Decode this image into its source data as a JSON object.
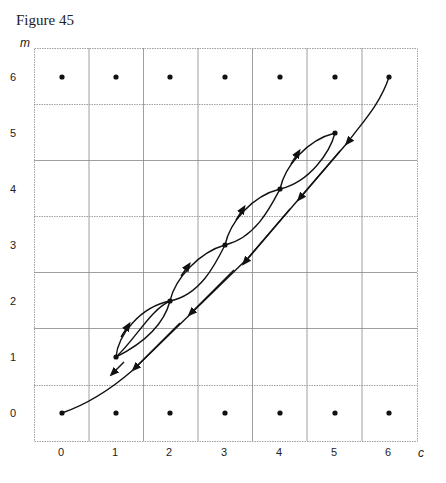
{
  "figure": {
    "title": "Figure 45",
    "x_axis_label": "c",
    "y_axis_label": "m",
    "x_ticks": [
      "0",
      "1",
      "2",
      "3",
      "4",
      "5",
      "6"
    ],
    "y_ticks": [
      "6",
      "5",
      "4",
      "3",
      "2",
      "1",
      "0"
    ]
  },
  "diagram": {
    "grid": {
      "cols": 7,
      "rows": 7
    },
    "dot_rows": [
      0,
      6
    ],
    "diagonal_points": [
      [
        0,
        0
      ],
      [
        1,
        1
      ],
      [
        2,
        2
      ],
      [
        3,
        3
      ],
      [
        4,
        4
      ],
      [
        5,
        5
      ],
      [
        6,
        6
      ]
    ],
    "long_path": {
      "from": [
        6,
        6
      ],
      "to": [
        0,
        0
      ],
      "arrow_direction": "down-left"
    },
    "lens_loops": [
      {
        "from": [
          1,
          1
        ],
        "to": [
          2,
          2
        ]
      },
      {
        "from": [
          2,
          2
        ],
        "to": [
          3,
          3
        ]
      },
      {
        "from": [
          3,
          3
        ],
        "to": [
          4,
          4
        ]
      },
      {
        "from": [
          4,
          4
        ],
        "to": [
          5,
          5
        ]
      }
    ],
    "colors": {
      "line": "#111111",
      "grid": "#888888"
    }
  }
}
